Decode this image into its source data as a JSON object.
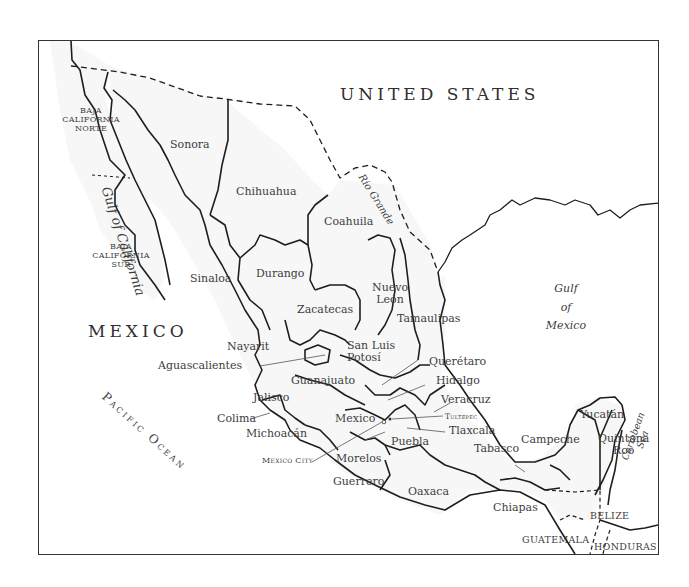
{
  "map": {
    "title_countries": {
      "usa": "UNITED STATES",
      "mexico": "MEXICO",
      "belize": "BELIZE",
      "guatemala": "GUATEMALA",
      "honduras": "HONDURAS"
    },
    "water_bodies": {
      "gulf_of_california": "Gulf of California",
      "gulf_of_mexico_line1": "Gulf",
      "gulf_of_mexico_line2": "of",
      "gulf_of_mexico_line3": "Mexico",
      "pacific_ocean": "Pacific Ocean",
      "caribbean_line1": "Caribbean",
      "caribbean_line2": "Sea",
      "rio_grande": "Rio Grande"
    },
    "states": {
      "baja_norte_1": "BAJA",
      "baja_norte_2": "CALIFORNIA",
      "baja_norte_3": "NORTE",
      "baja_sur_1": "BAJA",
      "baja_sur_2": "CALIFORNIA",
      "baja_sur_3": "SUR",
      "sonora": "Sonora",
      "chihuahua": "Chihuahua",
      "coahuila": "Coahuila",
      "sinaloa": "Sinaloa",
      "durango": "Durango",
      "nuevo_leon_1": "Nuevo",
      "nuevo_leon_2": "León",
      "tamaulipas": "Tamaulipas",
      "zacatecas": "Zacatecas",
      "nayarit": "Nayarit",
      "aguascalientes": "Aguascalientes",
      "san_luis_potosi_1": "San Luis",
      "san_luis_potosi_2": "Potosí",
      "queretaro": "Querétaro",
      "hidalgo": "Hidalgo",
      "veracruz": "Veracruz",
      "guanajuato": "Guanajuato",
      "jalisco": "Jalisco",
      "colima": "Colima",
      "michoacan": "Michoacán",
      "mexico": "Mexico",
      "tlaxcala": "Tlaxcala",
      "puebla": "Puebla",
      "morelos": "Morelos",
      "guerrero": "Guerrero",
      "oaxaca": "Oaxaca",
      "tabasco": "Tabasco",
      "campeche": "Campeche",
      "yucatan": "Yucatán",
      "quintana_roo_1": "Quintana",
      "quintana_roo_2": "Roo",
      "chiapas": "Chiapas"
    },
    "cities": {
      "tultepec": "Tultepec",
      "mexico_city": "Mexico City"
    },
    "colors": {
      "land": "#f7f7f7",
      "border": "#1e1e1e",
      "text": "#3d3d3d",
      "water": "#ffffff"
    }
  }
}
